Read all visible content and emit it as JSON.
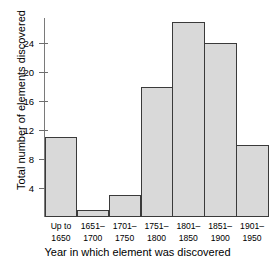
{
  "chart_data": {
    "type": "bar",
    "title": "",
    "subtitle": "",
    "xlabel": "Year in which element was discovered",
    "ylabel": "Total number of elements discovered",
    "categories": [
      "Up to 1650",
      "1651–1700",
      "1701–1750",
      "1751–1800",
      "1801–1850",
      "1851–1900",
      "1901–1950"
    ],
    "category_lines": [
      {
        "line1": "Up to",
        "line2": "1650"
      },
      {
        "line1": "1651–",
        "line2": "1700"
      },
      {
        "line1": "1701–",
        "line2": "1750"
      },
      {
        "line1": "1751–",
        "line2": "1800"
      },
      {
        "line1": "1801–",
        "line2": "1850"
      },
      {
        "line1": "1851–",
        "line2": "1900"
      },
      {
        "line1": "1901–",
        "line2": "1950"
      }
    ],
    "values": [
      11,
      1,
      3,
      18,
      27,
      24,
      10
    ],
    "ylim": [
      0,
      27.5
    ],
    "yticks": [
      4,
      8,
      12,
      16,
      20,
      24
    ],
    "ytick_labels": [
      "4",
      "8",
      "12",
      "16",
      "20",
      "24"
    ],
    "grid": false,
    "legend": null,
    "bar_fill_color": "#d9d9d9",
    "bar_edge_color": "#3a3a3a",
    "axis_color": "#7a7a7a",
    "background_color": "#ffffff"
  }
}
